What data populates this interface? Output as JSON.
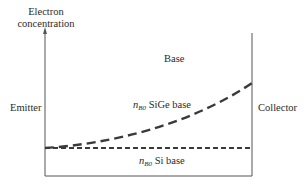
{
  "diagram": {
    "y_axis_label_line1": "Electron",
    "y_axis_label_line2": "concentration",
    "region_base": "Base",
    "region_emitter": "Emitter",
    "region_collector": "Collector",
    "curves": [
      {
        "var": "n",
        "sub": "B0",
        "label": "SiGe base",
        "style": "dashed",
        "shape": "increasing-exponential"
      },
      {
        "var": "n",
        "sub": "B0",
        "label": "Si base",
        "style": "dashed",
        "shape": "flat"
      }
    ],
    "colors": {
      "axis": "#555555",
      "curve": "#3a3a3a",
      "text": "#2a2a2a"
    }
  }
}
